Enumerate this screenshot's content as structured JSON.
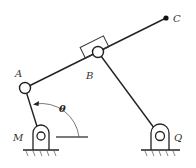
{
  "diagram": {
    "type": "four-bar linkage mechanism",
    "colors": {
      "line": "#222222",
      "label": "#333333",
      "background": "#ffffff"
    },
    "points": {
      "A": {
        "label": "A",
        "x": 25,
        "y": 88
      },
      "B": {
        "label": "B",
        "x": 98,
        "y": 52
      },
      "C": {
        "label": "C",
        "x": 166,
        "y": 18
      },
      "M": {
        "label": "M",
        "x": 40,
        "y": 136
      },
      "Q": {
        "label": "Q",
        "x": 160,
        "y": 136
      }
    },
    "angle": {
      "label": "θ",
      "between": [
        "link MA",
        "horizontal through M"
      ]
    },
    "links": [
      "M-A",
      "A-B-C",
      "B-Q"
    ],
    "supports": [
      "M",
      "Q"
    ],
    "slider": {
      "at": "B",
      "label": ""
    }
  }
}
